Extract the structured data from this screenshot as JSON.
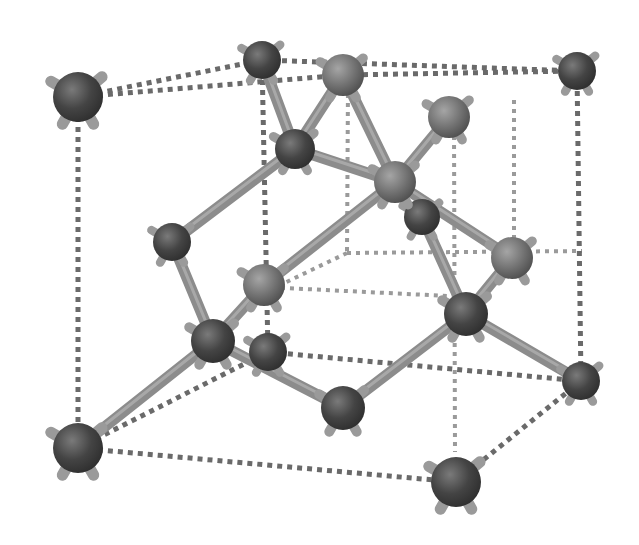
{
  "diagram": {
    "type": "crystal-lattice-ball-and-stick",
    "colors": {
      "background": "#ffffff",
      "atom_dark": "#3a3a3a",
      "atom_mid": "#6b6b6b",
      "atom_light": "#8a8a8a",
      "bond": "#8c8c8c",
      "bond_light": "#b5b5b5",
      "stub": "#9a9a9a",
      "dotted_line": "#6a6a6a",
      "dotted_line_back": "#9a9a9a"
    },
    "atoms": [
      {
        "id": "a1",
        "x": 78,
        "y": 97,
        "r": 25,
        "tone": "dark"
      },
      {
        "id": "a2",
        "x": 262,
        "y": 60,
        "r": 19,
        "tone": "dark"
      },
      {
        "id": "a3",
        "x": 343,
        "y": 75,
        "r": 21,
        "tone": "light"
      },
      {
        "id": "a4",
        "x": 577,
        "y": 71,
        "r": 19,
        "tone": "dark"
      },
      {
        "id": "a5",
        "x": 449,
        "y": 117,
        "r": 21,
        "tone": "light"
      },
      {
        "id": "a6",
        "x": 295,
        "y": 149,
        "r": 20,
        "tone": "dark"
      },
      {
        "id": "a7",
        "x": 395,
        "y": 182,
        "r": 21,
        "tone": "light"
      },
      {
        "id": "a8",
        "x": 422,
        "y": 217,
        "r": 18,
        "tone": "dark"
      },
      {
        "id": "a9",
        "x": 172,
        "y": 242,
        "r": 19,
        "tone": "dark"
      },
      {
        "id": "a10",
        "x": 512,
        "y": 258,
        "r": 21,
        "tone": "light"
      },
      {
        "id": "a11",
        "x": 264,
        "y": 285,
        "r": 21,
        "tone": "light"
      },
      {
        "id": "a12",
        "x": 466,
        "y": 314,
        "r": 22,
        "tone": "dark"
      },
      {
        "id": "a13",
        "x": 213,
        "y": 341,
        "r": 22,
        "tone": "dark"
      },
      {
        "id": "a14",
        "x": 268,
        "y": 352,
        "r": 19,
        "tone": "dark"
      },
      {
        "id": "a15",
        "x": 581,
        "y": 381,
        "r": 19,
        "tone": "dark"
      },
      {
        "id": "a16",
        "x": 343,
        "y": 408,
        "r": 22,
        "tone": "dark"
      },
      {
        "id": "a17",
        "x": 78,
        "y": 448,
        "r": 25,
        "tone": "dark"
      },
      {
        "id": "a18",
        "x": 456,
        "y": 482,
        "r": 25,
        "tone": "dark"
      }
    ],
    "bonds": [
      [
        "a2",
        "a6"
      ],
      [
        "a3",
        "a6"
      ],
      [
        "a3",
        "a7"
      ],
      [
        "a6",
        "a7"
      ],
      [
        "a5",
        "a7"
      ],
      [
        "a6",
        "a9"
      ],
      [
        "a7",
        "a11"
      ],
      [
        "a7",
        "a10"
      ],
      [
        "a8",
        "a12"
      ],
      [
        "a10",
        "a12"
      ],
      [
        "a12",
        "a16"
      ],
      [
        "a12",
        "a15"
      ],
      [
        "a9",
        "a13"
      ],
      [
        "a11",
        "a13"
      ],
      [
        "a13",
        "a17"
      ],
      [
        "a13",
        "a16"
      ],
      [
        "a11",
        "a13"
      ]
    ],
    "dotted_edges_front": [
      [
        "a1",
        "a2"
      ],
      [
        "a1",
        "a3"
      ],
      [
        "a2",
        "a4"
      ],
      [
        "a3",
        "a4"
      ],
      [
        "a1",
        "a17"
      ],
      [
        "a4",
        "a15"
      ],
      [
        "a17",
        "a18"
      ],
      [
        "a15",
        "a18"
      ],
      [
        "a17",
        "a14"
      ],
      [
        "a14",
        "a15"
      ],
      [
        "a2",
        "a14"
      ]
    ],
    "dotted_edges_back": [
      [
        348,
        85,
        347,
        253
      ],
      [
        347,
        253,
        582,
        251
      ],
      [
        347,
        253,
        276,
        287
      ],
      [
        514,
        100,
        514,
        253
      ],
      [
        454,
        127,
        455,
        452
      ],
      [
        263,
        287,
        470,
        297
      ]
    ]
  }
}
